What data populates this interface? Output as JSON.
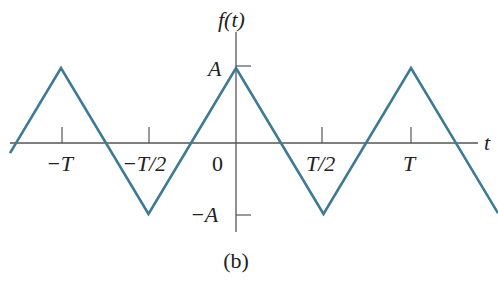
{
  "chart_data": {
    "type": "line",
    "title": "",
    "ylabel": "f(t)",
    "xlabel": "t",
    "caption": "(b)",
    "color": "#3e7a93",
    "x_ticks": [
      {
        "label": "−T",
        "value": -1.0
      },
      {
        "label": "−T/2",
        "value": -0.5
      },
      {
        "label": "0",
        "value": 0
      },
      {
        "label": "T/2",
        "value": 0.5
      },
      {
        "label": "T",
        "value": 1.0
      }
    ],
    "y_ticks": [
      {
        "label": "A",
        "value": 1
      },
      {
        "label": "−A",
        "value": -1
      }
    ],
    "series": [
      {
        "name": "triangle wave f(t)",
        "x": [
          -1.5,
          -1.0,
          -0.5,
          0,
          0.5,
          1.0,
          1.5
        ],
        "y": [
          -1,
          1,
          -1,
          1,
          -1,
          1,
          -1
        ]
      }
    ],
    "xlim": [
      -1.3,
      1.5
    ],
    "ylim": [
      -1.2,
      1.4
    ],
    "grid": false,
    "legend": "none"
  }
}
